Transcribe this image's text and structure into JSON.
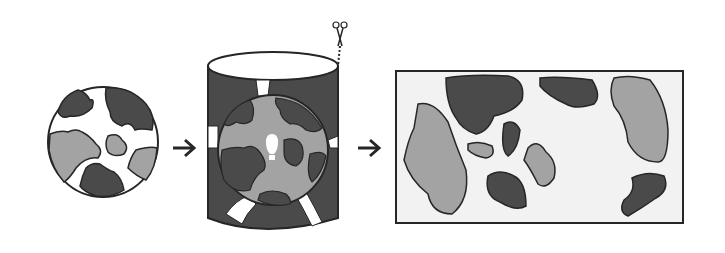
{
  "diagram": {
    "stages": [
      {
        "id": "globe",
        "label": "Globe"
      },
      {
        "id": "cylinder",
        "label": "Cylinder projection with light source"
      },
      {
        "id": "flat-map",
        "label": "Unrolled flat map"
      }
    ],
    "arrows": [
      "globe-to-cylinder",
      "cylinder-to-map"
    ],
    "colors": {
      "dark_land": "#4a4a4a",
      "light_land": "#a3a3a3",
      "ocean": "#ffffff",
      "map_background": "#f2f2f2",
      "outline": "#262626"
    }
  }
}
